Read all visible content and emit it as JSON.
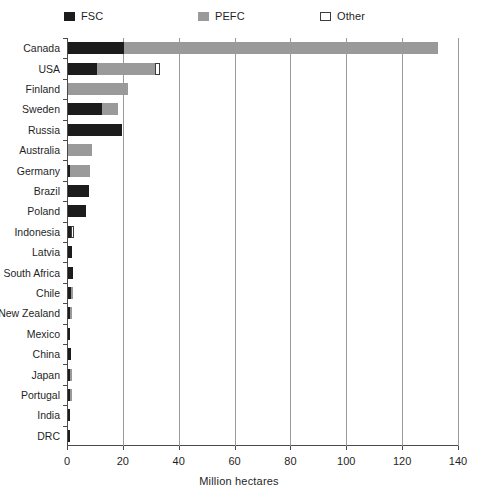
{
  "chart_data": {
    "type": "bar",
    "orientation": "horizontal",
    "stacked": true,
    "title": "",
    "xlabel": "Million hectares",
    "ylabel": "",
    "xlim": [
      0,
      140
    ],
    "xticks": [
      0,
      20,
      40,
      60,
      80,
      100,
      120,
      140
    ],
    "xtick_labels": [
      "0",
      "20",
      "40",
      "60",
      "80",
      "100",
      "120",
      "140"
    ],
    "grid": true,
    "grid_axis": "x",
    "legend_position": "top",
    "categories": [
      "Canada",
      "USA",
      "Finland",
      "Sweden",
      "Russia",
      "Australia",
      "Germany",
      "Brazil",
      "Poland",
      "Indonesia",
      "Latvia",
      "South Africa",
      "Chile",
      "New Zealand",
      "Mexico",
      "China",
      "Japan",
      "Portugal",
      "India",
      "DRC"
    ],
    "series": [
      {
        "name": "FSC",
        "color": "#1c1c1c",
        "values": [
          20.0,
          10.4,
          0.0,
          12.0,
          19.5,
          0.0,
          0.8,
          7.5,
          6.5,
          1.2,
          1.5,
          1.8,
          1.0,
          0.6,
          0.7,
          0.9,
          0.4,
          0.4,
          0.3,
          0.3
        ]
      },
      {
        "name": "PEFC",
        "color": "#9a9a9a",
        "values": [
          112.5,
          20.6,
          21.5,
          6.0,
          0.0,
          8.6,
          7.2,
          0.0,
          0.0,
          0.0,
          0.0,
          0.0,
          0.5,
          0.4,
          0.0,
          0.0,
          0.3,
          0.3,
          0.0,
          0.0
        ]
      },
      {
        "name": "Other",
        "color": "#ffffff",
        "values": [
          0.0,
          2.0,
          0.0,
          0.0,
          0.0,
          0.0,
          0.0,
          0.0,
          0.0,
          1.1,
          0.0,
          0.0,
          0.0,
          0.0,
          0.0,
          0.0,
          0.0,
          0.0,
          0.0,
          0.0
        ]
      }
    ],
    "totals": [
      132.5,
      33.0,
      21.5,
      18.0,
      19.5,
      8.6,
      8.0,
      7.5,
      6.5,
      2.3,
      1.5,
      1.8,
      1.5,
      1.0,
      0.7,
      0.9,
      0.7,
      0.7,
      0.3,
      0.3
    ]
  },
  "legend": {
    "items": [
      {
        "label": "FSC",
        "swatch": "legend-swatch-fsc"
      },
      {
        "label": "PEFC",
        "swatch": "legend-swatch-pefc"
      },
      {
        "label": "Other",
        "swatch": "legend-swatch-other"
      }
    ]
  },
  "colors": {
    "fsc": "#1c1c1c",
    "pefc": "#9a9a9a",
    "other": "#ffffff",
    "axis": "#4a4a4a",
    "grid": "#9a9a9a",
    "text": "#1f1f1f"
  }
}
